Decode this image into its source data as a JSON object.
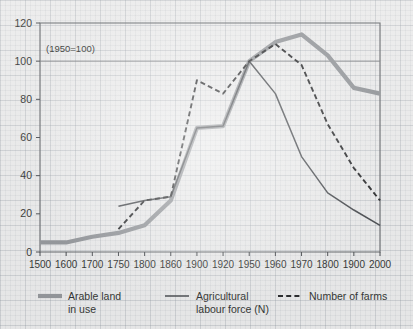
{
  "chart_data": {
    "type": "line",
    "title": "",
    "subtitle": "",
    "annotation": "(1950=100)",
    "xlabel": "",
    "ylabel": "",
    "grid": "major-horizontal-at-100-and-frame",
    "legend_position": "below-plot",
    "categories": [
      "1500",
      "1600",
      "1700",
      "1750",
      "1800",
      "1860",
      "1900",
      "1920",
      "1950",
      "1960",
      "1970",
      "1800",
      "1900",
      "2000"
    ],
    "x_tick_labels": [
      "1500",
      "1600",
      "1700",
      "1750",
      "1800",
      "1860",
      "1900",
      "1920",
      "1950",
      "1960",
      "1970",
      "1800",
      "1900",
      "2000"
    ],
    "y_tick_labels": [
      "0",
      "20",
      "40",
      "60",
      "80",
      "100",
      "120"
    ],
    "y_ticks": [
      0,
      20,
      40,
      60,
      80,
      100,
      120
    ],
    "ylim": [
      0,
      120
    ],
    "series": [
      {
        "name": "Arable land in use",
        "style": "thick-solid-gray",
        "color": "#8a8d91",
        "x": [
          "1500",
          "1600",
          "1700",
          "1750",
          "1800",
          "1860",
          "1900",
          "1920",
          "1950",
          "1960",
          "1970",
          "1800",
          "1900",
          "2000"
        ],
        "values": [
          5,
          5,
          8,
          10,
          14,
          27,
          65,
          66,
          100,
          110,
          114,
          103,
          86,
          83
        ]
      },
      {
        "name": "Agricultural labour force (N)",
        "style": "thin-solid-black",
        "color": "#3a3d41",
        "x": [
          "1750",
          "1800",
          "1860",
          "1900",
          "1920",
          "1950",
          "1960",
          "1970",
          "1800",
          "1900",
          "2000"
        ],
        "values": [
          24,
          27,
          29,
          65,
          66,
          100,
          83,
          50,
          31,
          22,
          14
        ]
      },
      {
        "name": "Number of farms",
        "style": "dashed-black",
        "color": "#18191b",
        "x": [
          "1750",
          "1800",
          "1860",
          "1900",
          "1920",
          "1950",
          "1960",
          "1970",
          "1800",
          "1900",
          "2000"
        ],
        "values": [
          12,
          27,
          29,
          90,
          83,
          100,
          109,
          98,
          67,
          44,
          27
        ]
      }
    ]
  },
  "annotation": {
    "index_note": "(1950=100)"
  },
  "legend": {
    "items": [
      {
        "label_line1": "Arable land",
        "label_line2": "in use",
        "swatch": "thick-gray-line-swatch"
      },
      {
        "label_line1": "Agricultural",
        "label_line2": "labour force (N)",
        "swatch": "thin-black-line-swatch"
      },
      {
        "label_line1": "Number of farms",
        "label_line2": "",
        "swatch": "dashed-black-line-swatch"
      }
    ]
  },
  "colors": {
    "arable": "#8a8d91",
    "labour": "#3a3d41",
    "farms": "#18191b",
    "frame": "#55585c",
    "paper": "#e9e9e9"
  }
}
